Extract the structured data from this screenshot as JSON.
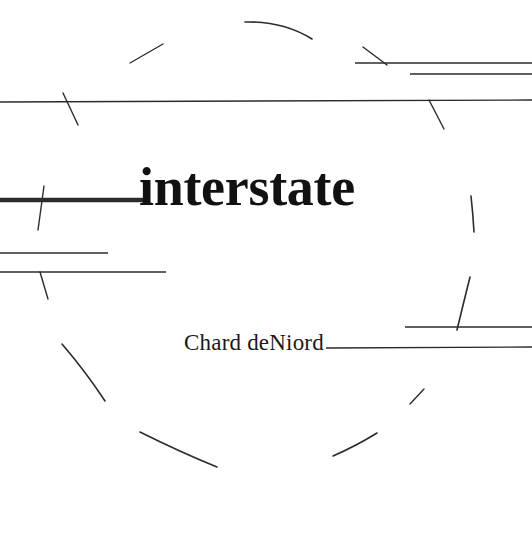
{
  "cover": {
    "title": "interstate",
    "author": "Chard deNiord",
    "background_color": "#ffffff",
    "ink_color": "#1a1a1a",
    "title_color": "#111111",
    "width": 532,
    "height": 538
  },
  "artwork": {
    "description": "minimal line-drawing of straight rules and broken circular arcs",
    "stroke_color": "#2b2b2b",
    "thin_stroke_width": 1.4,
    "bold_stroke_width": 4.5,
    "straight_lines": [
      {
        "name": "top-right-rule-upper",
        "x1": 355,
        "y1": 63,
        "x2": 532,
        "y2": 63
      },
      {
        "name": "top-right-rule-lower",
        "x1": 410,
        "y1": 74,
        "x2": 532,
        "y2": 74
      },
      {
        "name": "full-width-rule",
        "x1": 0,
        "y1": 102,
        "x2": 532,
        "y2": 100
      },
      {
        "name": "title-bold-rule",
        "x1": 0,
        "y1": 200,
        "x2": 150,
        "y2": 200
      },
      {
        "name": "left-rule-short",
        "x1": 0,
        "y1": 253,
        "x2": 108,
        "y2": 253
      },
      {
        "name": "left-rule-long",
        "x1": 0,
        "y1": 272,
        "x2": 166,
        "y2": 272
      },
      {
        "name": "right-rule-upper",
        "x1": 405,
        "y1": 327,
        "x2": 532,
        "y2": 327
      },
      {
        "name": "author-rule",
        "x1": 326,
        "y1": 348,
        "x2": 532,
        "y2": 347
      }
    ],
    "tick_marks": [
      {
        "name": "tick-top-left",
        "x1": 130,
        "y1": 63,
        "x2": 163,
        "y2": 44
      },
      {
        "name": "tick-top-right",
        "x1": 363,
        "y1": 47,
        "x2": 387,
        "y2": 65
      },
      {
        "name": "tick-rule-left",
        "x1": 63,
        "y1": 93,
        "x2": 78,
        "y2": 125
      },
      {
        "name": "tick-rule-right",
        "x1": 429,
        "y1": 100,
        "x2": 444,
        "y2": 129
      },
      {
        "name": "tick-bold-rule",
        "x1": 44,
        "y1": 186,
        "x2": 38,
        "y2": 230
      },
      {
        "name": "tick-left-rule-long",
        "x1": 40,
        "y1": 272,
        "x2": 48,
        "y2": 299
      },
      {
        "name": "tick-small-right",
        "x1": 410,
        "y1": 404,
        "x2": 424,
        "y2": 389
      }
    ],
    "arcs": [
      {
        "name": "arc-top-center",
        "d": "M 245 22 Q 283 21 312 39"
      },
      {
        "name": "arc-right-upper",
        "d": "M 471 196 Q 473 214 474 232"
      },
      {
        "name": "arc-right-lower",
        "d": "M 470 277 Q 463 305 457 330"
      },
      {
        "name": "arc-left-upper",
        "d": "M 62 344 Q 86 372 105 401"
      },
      {
        "name": "arc-bottom-left",
        "d": "M 140 432 Q 180 452 217 467"
      },
      {
        "name": "arc-bottom-right",
        "d": "M 333 456 Q 356 446 377 433"
      }
    ]
  }
}
